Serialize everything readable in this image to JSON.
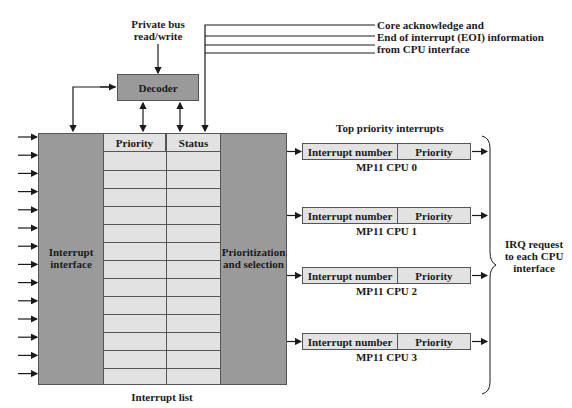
{
  "title_private_bus": [
    "Private bus",
    "read/write"
  ],
  "decoder": {
    "label": "Decoder"
  },
  "feedback": {
    "lines": [
      "Core acknowledge and",
      "End of interrupt (EOI) information",
      "from CPU interface"
    ]
  },
  "interrupt_interface": {
    "label": [
      "Interrupt",
      "interface"
    ],
    "input_count": 14
  },
  "interrupt_list": {
    "caption": "Interrupt list",
    "columns": [
      "Priority",
      "Status"
    ],
    "row_count": 13
  },
  "prioritization": {
    "label": [
      "Prioritization",
      "and selection"
    ]
  },
  "top_priority": {
    "heading": "Top priority interrupts",
    "cpus": [
      {
        "fields": [
          "Interrupt number",
          "Priority"
        ],
        "name": "MP11 CPU 0"
      },
      {
        "fields": [
          "Interrupt number",
          "Priority"
        ],
        "name": "MP11 CPU 1"
      },
      {
        "fields": [
          "Interrupt number",
          "Priority"
        ],
        "name": "MP11 CPU 2"
      },
      {
        "fields": [
          "Interrupt number",
          "Priority"
        ],
        "name": "MP11 CPU 3"
      }
    ]
  },
  "irq": {
    "label": [
      "IRQ request",
      "to each CPU",
      "interface"
    ]
  },
  "colors": {
    "dark_block": "#9a9a9a",
    "light_cell": "#e2e2e2",
    "line": "#1a1a1a"
  }
}
